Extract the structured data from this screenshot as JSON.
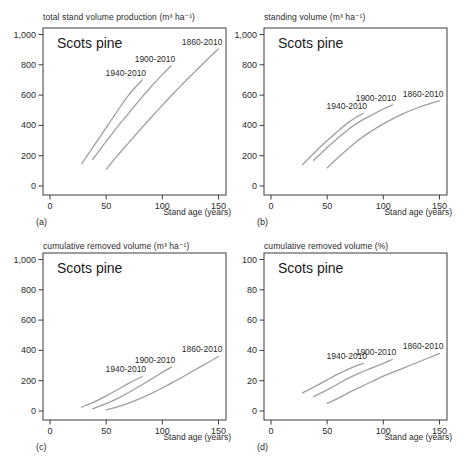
{
  "figure": {
    "background": "#ffffff",
    "text_color": "#2b2b2b",
    "axis_color": "#3c3c3c",
    "curve_color": "#9e9e9e",
    "species": "Scots pine",
    "x_axis_label": "Stand age (years)"
  },
  "chart_data": [
    {
      "type": "line",
      "panel_label": "(a)",
      "title": "total stand volume production (m³ ha⁻¹)",
      "annotation": "Scots pine",
      "xlabel": "Stand age (years)",
      "xlim": [
        0,
        150
      ],
      "xticks": [
        0,
        50,
        100,
        150
      ],
      "xtick_labels": [
        "0",
        "50",
        "100",
        "150"
      ],
      "ylim": [
        0,
        1000
      ],
      "yticks": [
        0,
        200,
        400,
        600,
        800,
        1000
      ],
      "ytick_labels": [
        "0",
        "200",
        "400",
        "600",
        "800",
        "1,000"
      ],
      "grid": false,
      "legend_position": "inline-labels",
      "series": [
        {
          "name": "1940-2010",
          "x": [
            28,
            40,
            50,
            60,
            70,
            82
          ],
          "y": [
            145,
            275,
            385,
            495,
            600,
            700
          ]
        },
        {
          "name": "1900-2010",
          "x": [
            38,
            50,
            60,
            70,
            80,
            90,
            100,
            108
          ],
          "y": [
            175,
            295,
            390,
            480,
            570,
            655,
            735,
            795
          ]
        },
        {
          "name": "1860-2010",
          "x": [
            50,
            60,
            70,
            80,
            90,
            100,
            110,
            120,
            130,
            140,
            150
          ],
          "y": [
            110,
            200,
            285,
            370,
            452,
            533,
            612,
            688,
            762,
            835,
            905
          ]
        }
      ]
    },
    {
      "type": "line",
      "panel_label": "(b)",
      "title": "standing volume (m³ ha⁻¹)",
      "annotation": "Scots pine",
      "xlabel": "Stand age (years)",
      "xlim": [
        0,
        150
      ],
      "xticks": [
        0,
        50,
        100,
        150
      ],
      "xtick_labels": [
        "0",
        "50",
        "100",
        "150"
      ],
      "ylim": [
        0,
        1000
      ],
      "yticks": [
        0,
        200,
        400,
        600,
        800,
        1000
      ],
      "ytick_labels": [
        "0",
        "200",
        "400",
        "600",
        "800",
        "1,000"
      ],
      "grid": false,
      "legend_position": "inline-labels",
      "series": [
        {
          "name": "1940-2010",
          "x": [
            28,
            40,
            50,
            60,
            70,
            82
          ],
          "y": [
            140,
            230,
            300,
            365,
            425,
            480
          ]
        },
        {
          "name": "1900-2010",
          "x": [
            38,
            50,
            60,
            70,
            80,
            90,
            100,
            108
          ],
          "y": [
            170,
            255,
            320,
            380,
            430,
            470,
            508,
            535
          ]
        },
        {
          "name": "1860-2010",
          "x": [
            50,
            60,
            70,
            80,
            90,
            100,
            110,
            120,
            130,
            140,
            150
          ],
          "y": [
            120,
            190,
            255,
            315,
            365,
            410,
            450,
            485,
            515,
            540,
            562
          ]
        }
      ]
    },
    {
      "type": "line",
      "panel_label": "(c)",
      "title": "cumulative removed volume (m³ ha⁻¹)",
      "annotation": "Scots pine",
      "xlabel": "Stand age (years)",
      "xlim": [
        0,
        150
      ],
      "xticks": [
        0,
        50,
        100,
        150
      ],
      "xtick_labels": [
        "0",
        "50",
        "100",
        "150"
      ],
      "ylim": [
        0,
        1000
      ],
      "yticks": [
        0,
        200,
        400,
        600,
        800,
        1000
      ],
      "ytick_labels": [
        "0",
        "200",
        "400",
        "600",
        "800",
        "1,000"
      ],
      "grid": false,
      "legend_position": "inline-labels",
      "series": [
        {
          "name": "1940-2010",
          "x": [
            28,
            40,
            50,
            60,
            70,
            82
          ],
          "y": [
            25,
            62,
            100,
            140,
            182,
            228
          ]
        },
        {
          "name": "1900-2010",
          "x": [
            38,
            50,
            60,
            70,
            80,
            90,
            100,
            108
          ],
          "y": [
            15,
            48,
            82,
            122,
            165,
            210,
            255,
            290
          ]
        },
        {
          "name": "1860-2010",
          "x": [
            50,
            60,
            70,
            80,
            90,
            100,
            110,
            120,
            130,
            140,
            150
          ],
          "y": [
            8,
            28,
            52,
            82,
            115,
            152,
            192,
            233,
            275,
            317,
            360
          ]
        }
      ]
    },
    {
      "type": "line",
      "panel_label": "(d)",
      "title": "cumulative removed volume (%)",
      "annotation": "Scots pine",
      "xlabel": "Stand age (years)",
      "xlim": [
        0,
        150
      ],
      "xticks": [
        0,
        50,
        100,
        150
      ],
      "xtick_labels": [
        "0",
        "50",
        "100",
        "150"
      ],
      "ylim": [
        0,
        100
      ],
      "yticks": [
        0,
        20,
        40,
        60,
        80,
        100
      ],
      "ytick_labels": [
        "0",
        "20",
        "40",
        "60",
        "80",
        "100"
      ],
      "grid": false,
      "legend_position": "inline-labels",
      "series": [
        {
          "name": "1940-2010",
          "x": [
            28,
            40,
            50,
            60,
            70,
            82
          ],
          "y": [
            12,
            16.5,
            20.5,
            24.5,
            28,
            31.5
          ]
        },
        {
          "name": "1900-2010",
          "x": [
            38,
            50,
            60,
            70,
            80,
            90,
            100,
            108
          ],
          "y": [
            9.5,
            14,
            18,
            22,
            25.5,
            28.5,
            31.5,
            34
          ]
        },
        {
          "name": "1860-2010",
          "x": [
            50,
            60,
            70,
            80,
            90,
            100,
            110,
            120,
            130,
            140,
            150
          ],
          "y": [
            5,
            8.5,
            12.5,
            16,
            19.5,
            23,
            26,
            29,
            32,
            35,
            38
          ]
        }
      ]
    }
  ]
}
